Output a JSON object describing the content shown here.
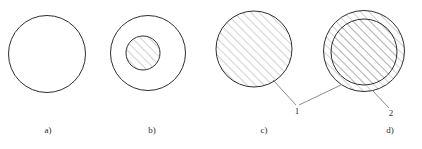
{
  "figure": {
    "background_color": "#ffffff",
    "outline_color": "#2e2e2e",
    "hatch_color": "#8d8d8d",
    "leader_color": "#6f6f6f",
    "text_color": "#2b2b2b",
    "width": 422,
    "height": 149
  },
  "chart_data": {
    "type": "diagram",
    "title": "",
    "hatch_angle_deg": 45,
    "hatch_spacing_px": 6,
    "panels": [
      {
        "id": "a",
        "caption": "a)",
        "caption_x": 48,
        "caption_y": 133,
        "circles": [
          {
            "name": "outer-circle",
            "cx": 47,
            "cy": 54,
            "r": 38.5,
            "filled": false,
            "hatched": false
          }
        ]
      },
      {
        "id": "b",
        "caption": "b)",
        "caption_x": 152,
        "caption_y": 133,
        "circles": [
          {
            "name": "outer-circle",
            "cx": 148,
            "cy": 53,
            "r": 37.5,
            "filled": false,
            "hatched": false
          },
          {
            "name": "inner-circle",
            "cx": 143,
            "cy": 53,
            "r": 17,
            "filled": false,
            "hatched": true
          }
        ]
      },
      {
        "id": "c",
        "caption": "c)",
        "caption_x": 264,
        "caption_y": 133,
        "circles": [
          {
            "name": "outer-circle",
            "cx": 254,
            "cy": 49,
            "r": 38,
            "filled": false,
            "hatched": true
          }
        ]
      },
      {
        "id": "d",
        "caption": "d)",
        "caption_x": 390,
        "caption_y": 133,
        "circles": [
          {
            "name": "outer-circle",
            "cx": 364,
            "cy": 51,
            "r": 40.5,
            "filled": false,
            "hatched": true
          },
          {
            "name": "inner-circle",
            "cx": 364,
            "cy": 52,
            "r": 33,
            "filled": false,
            "hatched": true
          }
        ]
      }
    ],
    "callouts": [
      {
        "label": "1",
        "label_x": 297,
        "label_y": 114,
        "leaders": [
          {
            "from_x": 273,
            "from_y": 80,
            "to_x": 296,
            "to_y": 105
          },
          {
            "from_x": 341,
            "from_y": 85,
            "to_x": 299,
            "to_y": 105
          }
        ]
      },
      {
        "label": "2",
        "label_x": 391,
        "label_y": 116,
        "leaders": [
          {
            "from_x": 372,
            "from_y": 90,
            "to_x": 389,
            "to_y": 108
          }
        ]
      }
    ]
  }
}
